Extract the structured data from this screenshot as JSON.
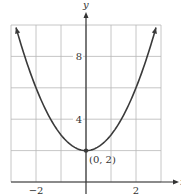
{
  "chart_data": {
    "type": "line",
    "title": "",
    "xlabel": "x",
    "ylabel": "y",
    "function": "y = x^2 + 2",
    "xlim": [
      -3,
      3
    ],
    "ylim": [
      0,
      10
    ],
    "grid": true,
    "x_ticks": [
      {
        "value": -2,
        "label": "−2"
      },
      {
        "value": 2,
        "label": "2"
      }
    ],
    "y_ticks": [
      {
        "value": 4,
        "label": "4"
      },
      {
        "value": 8,
        "label": "8"
      }
    ],
    "grid_x_step": 1,
    "grid_y_step": 2,
    "series": [
      {
        "name": "parabola",
        "x": [
          -2.8,
          -2.5,
          -2,
          -1.5,
          -1,
          -0.5,
          0,
          0.5,
          1,
          1.5,
          2,
          2.5,
          2.8
        ],
        "values": [
          9.84,
          8.25,
          6,
          4.25,
          3,
          2.25,
          2,
          2.25,
          3,
          4.25,
          6,
          8.25,
          9.84
        ]
      }
    ],
    "annotations": [
      {
        "type": "point",
        "x": 0,
        "y": 2,
        "label": "(0, 2)"
      }
    ]
  },
  "axes": {
    "x_label": "x",
    "y_label": "y"
  },
  "colors": {
    "curve": "#3a3a3a",
    "grid": "#b8b8b8",
    "axis": "#333333"
  }
}
